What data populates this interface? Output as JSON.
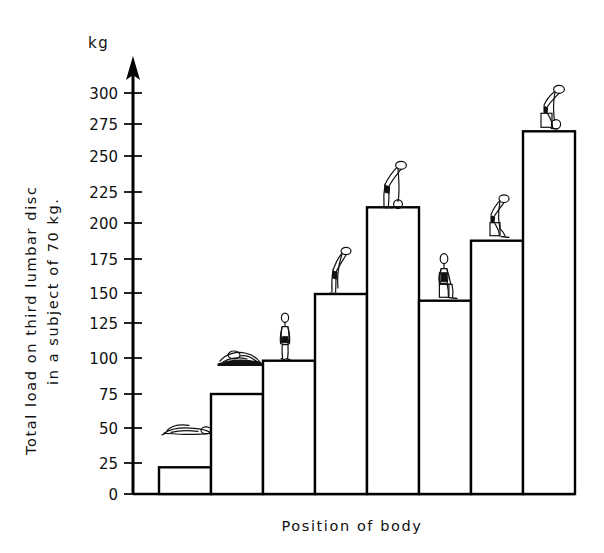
{
  "chart_data": {
    "type": "bar",
    "title": "",
    "subtitle": "",
    "unit_label": "kg",
    "ylabel_line1": "Total load on third lumbar disc",
    "ylabel_line2": "in a subject of 70 kg.",
    "xlabel": "Position of body",
    "ylim": [
      0,
      300
    ],
    "grid": false,
    "legend": "none",
    "yticks": [
      0,
      25,
      50,
      75,
      100,
      125,
      150,
      175,
      200,
      225,
      250,
      275,
      300
    ],
    "ytick_labels": [
      "0",
      "25",
      "50",
      "75",
      "100",
      "125",
      "150",
      "175",
      "200",
      "225",
      "250",
      "275",
      "300"
    ],
    "categories": [
      "lying supine",
      "lying on side",
      "standing upright",
      "standing bent forward",
      "standing bent forward holding weight",
      "sitting upright",
      "sitting bent forward",
      "sitting bent forward holding weight"
    ],
    "xtick_labels": [
      "",
      "",
      "",
      "",
      "",
      "",
      "",
      ""
    ],
    "values": [
      20,
      75,
      100,
      150,
      215,
      145,
      190,
      272
    ],
    "bars": [
      {
        "index": 1,
        "value": 20,
        "posture": "lying-supine",
        "icon": "figure-lying-supine"
      },
      {
        "index": 2,
        "value": 75,
        "posture": "lying-on-side",
        "icon": "figure-lying-side"
      },
      {
        "index": 3,
        "value": 100,
        "posture": "standing-upright",
        "icon": "figure-standing"
      },
      {
        "index": 4,
        "value": 150,
        "posture": "standing-bent-forward",
        "icon": "figure-standing-bent"
      },
      {
        "index": 5,
        "value": 215,
        "posture": "standing-bent-forward-with-load",
        "icon": "figure-standing-bent-load"
      },
      {
        "index": 6,
        "value": 145,
        "posture": "sitting-upright",
        "icon": "figure-sitting"
      },
      {
        "index": 7,
        "value": 190,
        "posture": "sitting-bent-forward",
        "icon": "figure-sitting-bent"
      },
      {
        "index": 8,
        "value": 272,
        "posture": "sitting-bent-forward-with-load",
        "icon": "figure-sitting-bent-load"
      }
    ],
    "colors": {
      "bar_fill": "#ffffff",
      "bar_stroke": "#000000",
      "axis": "#000000",
      "text": "#111111",
      "background": "#ffffff"
    }
  }
}
